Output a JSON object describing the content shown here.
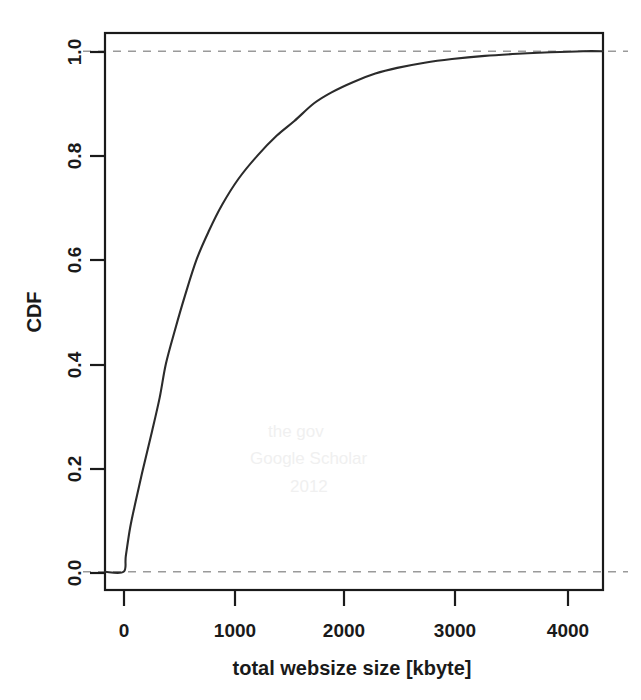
{
  "chart_data": {
    "type": "line",
    "title": "",
    "subtitle": "",
    "xlabel": "total websize size [kbyte]",
    "ylabel": "CDF",
    "xlim": [
      -170,
      4380
    ],
    "ylim": [
      -0.035,
      1.035
    ],
    "xticks": [
      0,
      1000,
      2000,
      3000,
      4000
    ],
    "xticklabels": [
      "0",
      "1000",
      "2000",
      "3000",
      "4000"
    ],
    "yticks": [
      0.0,
      0.2,
      0.4,
      0.6,
      0.8,
      1.0
    ],
    "yticklabels": [
      "0.0",
      "0.2",
      "0.4",
      "0.6",
      "0.8",
      "1.0"
    ],
    "grid": false,
    "legend": null,
    "reference_lines": [
      {
        "axis": "y",
        "value": 0.0,
        "style": "dashed",
        "color": "#9a9a9a"
      },
      {
        "axis": "y",
        "value": 1.0,
        "style": "dashed",
        "color": "#9a9a9a"
      }
    ],
    "series": [
      {
        "name": "CDF of total website size",
        "color": "#2b2b2b",
        "x": [
          -170,
          0,
          20,
          60,
          110,
          180,
          260,
          330,
          387,
          470,
          560,
          667,
          780,
          900,
          1050,
          1225,
          1400,
          1560,
          1740,
          1900,
          2100,
          2300,
          2500,
          2750,
          3000,
          3300,
          3600,
          3900,
          4200,
          4380
        ],
        "y": [
          0.0,
          0.0,
          0.03,
          0.085,
          0.135,
          0.2,
          0.27,
          0.335,
          0.4,
          0.465,
          0.53,
          0.6,
          0.655,
          0.705,
          0.755,
          0.8,
          0.838,
          0.866,
          0.9,
          0.921,
          0.941,
          0.957,
          0.968,
          0.978,
          0.985,
          0.991,
          0.995,
          0.998,
          1.0,
          1.0
        ]
      }
    ],
    "annotations": []
  },
  "axes": {
    "x_axis_name": "x-axis",
    "y_axis_name": "y-axis"
  },
  "geometry": {
    "plot_left": 105,
    "plot_right": 603,
    "plot_top": 33,
    "plot_bottom": 590
  },
  "ghost_artifacts": [
    {
      "text": "the gov",
      "x": 268,
      "y": 437
    },
    {
      "text": "Google Scholar",
      "x": 250,
      "y": 464
    },
    {
      "text": "2012",
      "x": 290,
      "y": 492
    }
  ]
}
